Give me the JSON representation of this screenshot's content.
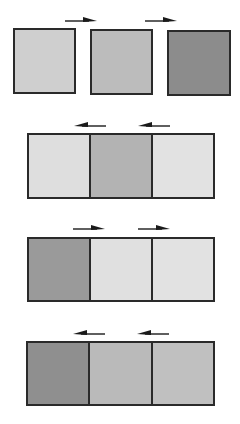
{
  "diagram": {
    "colors": {
      "light": "#dcdcdc",
      "medium": "#bdbdbd",
      "dark": "#8f8f8f",
      "lightest": "#e4e4e4",
      "border": "#2a2a2a"
    },
    "rows": [
      {
        "layout": "separate",
        "arrow_direction": "right",
        "cells": [
          {
            "shade": "#cfcfcf"
          },
          {
            "shade": "#bcbcbc"
          },
          {
            "shade": "#8c8c8c"
          }
        ]
      },
      {
        "layout": "joined",
        "arrow_direction": "left",
        "cells": [
          {
            "shade": "#dedede"
          },
          {
            "shade": "#b3b3b3"
          },
          {
            "shade": "#e2e2e2"
          }
        ]
      },
      {
        "layout": "joined",
        "arrow_direction": "right",
        "cells": [
          {
            "shade": "#9a9a9a"
          },
          {
            "shade": "#e0e0e0"
          },
          {
            "shade": "#e2e2e2"
          }
        ]
      },
      {
        "layout": "joined",
        "arrow_direction": "left",
        "cells": [
          {
            "shade": "#8f8f8f"
          },
          {
            "shade": "#bababa"
          },
          {
            "shade": "#c0c0c0"
          }
        ]
      }
    ]
  }
}
